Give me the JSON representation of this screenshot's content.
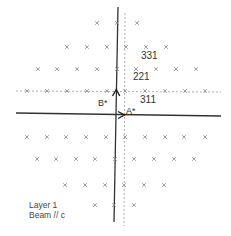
{
  "diagram": {
    "type": "reciprocal-lattice-diffraction-pattern",
    "colors": {
      "background": "#ffffff",
      "axis": "#333333",
      "dashed_guide": "#9a9a9a",
      "spot": "#8a8a8a",
      "text": "#333333"
    },
    "axes": {
      "a_star_label": "A*",
      "b_star_label": "B*"
    },
    "index_labels": [
      {
        "text": "331",
        "x": 141,
        "y": 51
      },
      {
        "text": "221",
        "x": 133,
        "y": 72
      },
      {
        "text": "311",
        "x": 140,
        "y": 95
      }
    ],
    "legend": {
      "line1": "Layer 1",
      "line2": "Beam // c"
    },
    "spot_rows": [
      {
        "y": 23,
        "xs": [
          97,
          117,
          137
        ]
      },
      {
        "y": 47,
        "xs": [
          67,
          87,
          107,
          126,
          146,
          166
        ]
      },
      {
        "y": 69,
        "xs": [
          38,
          57,
          77,
          97,
          117,
          136,
          156,
          176,
          196
        ]
      },
      {
        "y": 91,
        "xs": [
          27,
          47,
          67,
          87,
          107,
          125,
          145,
          165,
          185,
          205
        ]
      },
      {
        "y": 137,
        "xs": [
          27,
          47,
          66,
          86,
          106,
          125,
          145,
          165,
          184,
          205
        ]
      },
      {
        "y": 159,
        "xs": [
          37,
          56,
          76,
          95,
          115,
          134,
          154,
          174,
          194
        ]
      },
      {
        "y": 185,
        "xs": [
          65,
          85,
          105,
          124,
          144,
          164
        ]
      },
      {
        "y": 205,
        "xs": [
          95,
          114,
          134
        ]
      }
    ]
  }
}
